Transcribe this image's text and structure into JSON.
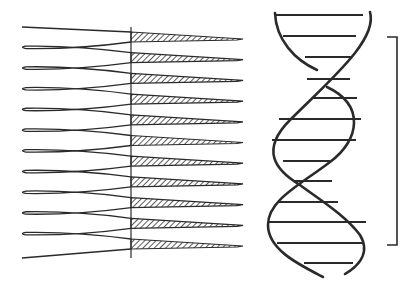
{
  "figure": {
    "title": "",
    "width": 417,
    "height": 293,
    "background": "#ffffff",
    "ink_color": "#2a2a2a",
    "hatch_color": "#333333"
  },
  "comb_diagram": {
    "description": "Folded strand (zigzag) meeting vertical axis with hatched tapering wedges",
    "axis": {
      "x": 131,
      "y_top": 27,
      "y_bottom": 258
    },
    "left_fold_x": 22,
    "wedge_tip_x": 243,
    "wedge_count": 11,
    "loop_count": 10,
    "start_y": 27,
    "row_spacing": 20.7,
    "wedge_half_height": 5
  },
  "helix_diagram": {
    "description": "Double helix with horizontal base-pair rungs",
    "strands": [
      "M275,13 C276,40 295,60 317,70",
      "M370,12 C378,40 330,80 290,120 C260,150 275,170 300,185 C320,200 345,215 360,235 C372,255 355,268 345,274",
      "M327,87 C365,105 360,140 330,162 C300,185 268,200 268,225 C268,250 300,265 323,277"
    ],
    "rungs": [
      {
        "y": 15,
        "x1": 275,
        "x2": 363
      },
      {
        "y": 36,
        "x1": 283,
        "x2": 356
      },
      {
        "y": 57,
        "x1": 305,
        "x2": 352
      },
      {
        "y": 79,
        "x1": 307,
        "x2": 350
      },
      {
        "y": 98,
        "x1": 313,
        "x2": 357
      },
      {
        "y": 119,
        "x1": 279,
        "x2": 361
      },
      {
        "y": 140,
        "x1": 272,
        "x2": 356
      },
      {
        "y": 161,
        "x1": 283,
        "x2": 330
      },
      {
        "y": 181,
        "x1": 293,
        "x2": 332
      },
      {
        "y": 202,
        "x1": 278,
        "x2": 338
      },
      {
        "y": 222,
        "x1": 268,
        "x2": 366
      },
      {
        "y": 243,
        "x1": 277,
        "x2": 364
      },
      {
        "y": 263,
        "x1": 304,
        "x2": 353
      }
    ]
  },
  "bracket": {
    "x": 397,
    "y_top": 37,
    "y_bottom": 245,
    "tick_left_x": 387
  }
}
